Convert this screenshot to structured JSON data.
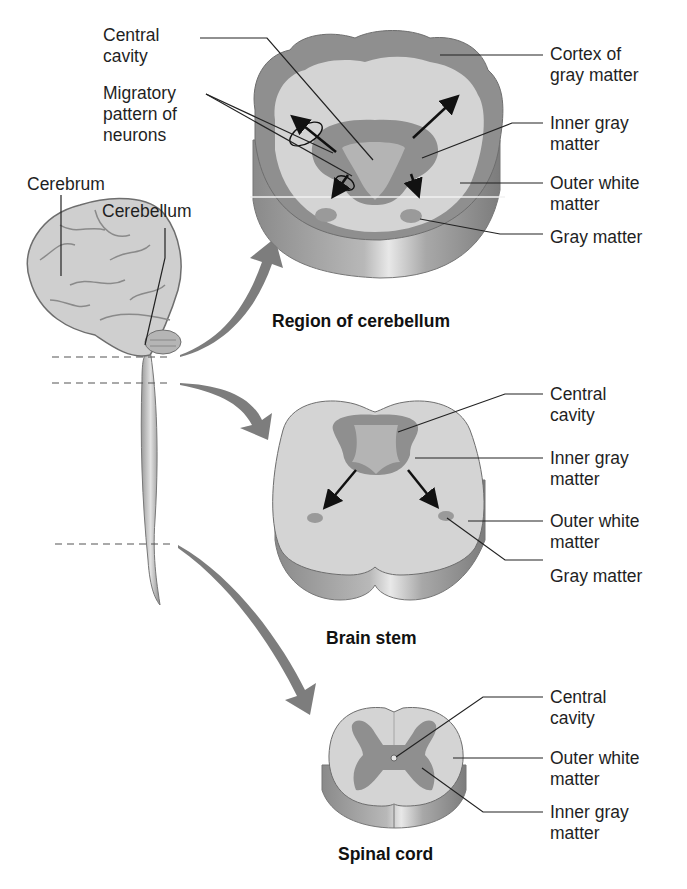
{
  "figure": {
    "colors": {
      "gray_matter": "#8e8e8e",
      "white_matter": "#d6d6d6",
      "side_wall": "#9a9a9a",
      "arrow": "#7a7a7a",
      "label_text": "#1f1f1f"
    }
  },
  "brain": {
    "labels": {
      "cerebrum": "Cerebrum",
      "cerebellum": "Cerebellum"
    }
  },
  "sections": {
    "cerebellum": {
      "caption": "Region of cerebellum",
      "left_labels": {
        "central_cavity": "Central\ncavity",
        "migratory": "Migratory\npattern of\nneurons"
      },
      "right_labels": [
        "Cortex of\ngray matter",
        "Inner gray\nmatter",
        "Outer white\nmatter",
        "Gray matter"
      ]
    },
    "brain_stem": {
      "caption": "Brain stem",
      "right_labels": [
        "Central\ncavity",
        "Inner gray\nmatter",
        "Outer white\nmatter",
        "Gray matter"
      ]
    },
    "spinal_cord": {
      "caption": "Spinal cord",
      "right_labels": [
        "Central\ncavity",
        "Outer white\nmatter",
        "Inner gray\nmatter"
      ]
    }
  }
}
